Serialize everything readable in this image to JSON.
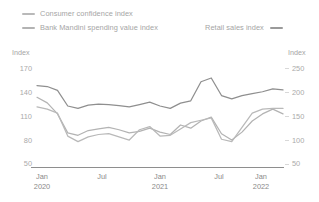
{
  "legend": {
    "items": [
      {
        "label": "Consumer confidence index",
        "color": "#b9b9b9",
        "icon": "line-swatch-icon",
        "axis": "left"
      },
      {
        "label": "Bank Mandini spending value index",
        "color": "#b3b3b3",
        "icon": "line-swatch-icon",
        "axis": "left"
      },
      {
        "label": "Retail sales index",
        "color": "#8f8f8f",
        "icon": "line-swatch-icon",
        "axis": "right"
      }
    ]
  },
  "axes": {
    "left": {
      "title": "Index",
      "ticks": [
        "170",
        "140",
        "110",
        "80",
        "50"
      ],
      "min": 50,
      "max": 170
    },
    "right": {
      "title": "Index",
      "ticks": [
        "250",
        "200",
        "150",
        "100",
        "50"
      ],
      "min": 50,
      "max": 250
    },
    "x": {
      "ticks": [
        {
          "month": "Jan",
          "year": "2020"
        },
        {
          "month": "Jul",
          "year": ""
        },
        {
          "month": "Jan",
          "year": "2021"
        },
        {
          "month": "Jul",
          "year": ""
        },
        {
          "month": "Jan",
          "year": "2022"
        }
      ]
    }
  },
  "chart_data": {
    "type": "line",
    "title": "",
    "xlabel": "",
    "ylabel": "Index",
    "grid": false,
    "legend_position": "top",
    "x": [
      "Jan 2020",
      "Feb 2020",
      "Mar 2020",
      "Apr 2020",
      "May 2020",
      "Jun 2020",
      "Jul 2020",
      "Aug 2020",
      "Sep 2020",
      "Oct 2020",
      "Nov 2020",
      "Dec 2020",
      "Jan 2021",
      "Feb 2021",
      "Mar 2021",
      "Apr 2021",
      "May 2021",
      "Jun 2021",
      "Jul 2021",
      "Aug 2021",
      "Sep 2021",
      "Oct 2021",
      "Nov 2021",
      "Dec 2021",
      "Jan 2022"
    ],
    "series": [
      {
        "name": "Consumer confidence index",
        "axis": "left",
        "color": "#b9b9b9",
        "ylim": [
          50,
          170
        ],
        "values": [
          121,
          118,
          113,
          84,
          77,
          83,
          86,
          87,
          83,
          79,
          92,
          96,
          84,
          85,
          93,
          101,
          104,
          107,
          80,
          77,
          95,
          113,
          118,
          119,
          119
        ]
      },
      {
        "name": "Bank Mandini spending value index",
        "axis": "left",
        "color": "#b3b3b3",
        "ylim": [
          50,
          170
        ],
        "values": [
          133,
          126,
          112,
          88,
          85,
          91,
          93,
          95,
          92,
          88,
          90,
          94,
          89,
          86,
          98,
          94,
          103,
          108,
          87,
          79,
          89,
          103,
          112,
          118,
          112
        ]
      },
      {
        "name": "Retail sales index",
        "axis": "right",
        "color": "#8f8f8f",
        "ylim": [
          50,
          250
        ],
        "values": [
          213,
          211,
          203,
          170,
          165,
          172,
          174,
          173,
          171,
          168,
          173,
          178,
          170,
          165,
          176,
          181,
          221,
          229,
          192,
          185,
          192,
          196,
          200,
          206,
          204
        ]
      }
    ]
  }
}
